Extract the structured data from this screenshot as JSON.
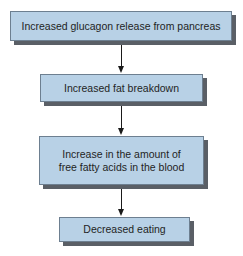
{
  "diagram": {
    "type": "flowchart",
    "direction": "top-to-bottom",
    "colors": {
      "box_fill": "#b8d1e6",
      "box_shadow": "#5a5f66",
      "arrow": "#1a1a1a"
    },
    "nodes": [
      {
        "id": "n1",
        "label": "Increased glucagon release from pancreas"
      },
      {
        "id": "n2",
        "label": "Increased fat breakdown"
      },
      {
        "id": "n3",
        "label": "Increase in the amount of free fatty acids in the blood"
      },
      {
        "id": "n4",
        "label": "Decreased eating"
      }
    ],
    "edges": [
      {
        "from": "n1",
        "to": "n2"
      },
      {
        "from": "n2",
        "to": "n3"
      },
      {
        "from": "n3",
        "to": "n4"
      }
    ]
  }
}
